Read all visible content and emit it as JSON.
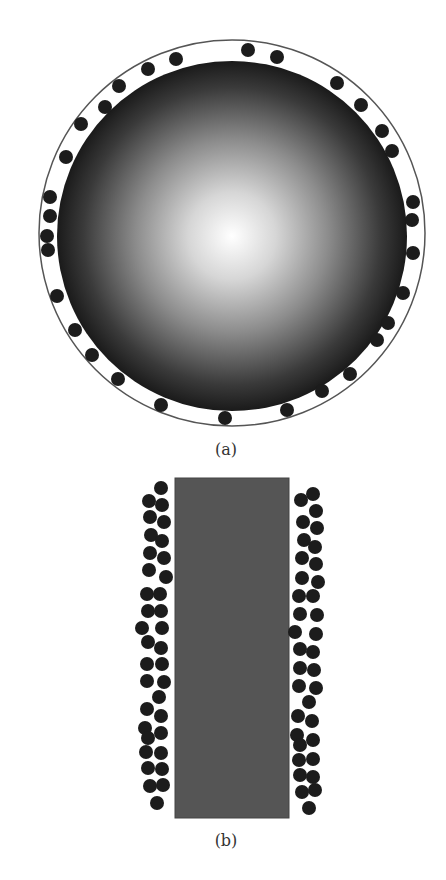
{
  "figure": {
    "panels": [
      {
        "id": "a",
        "label": "(a)",
        "description": "Spherical particle surrounded by small adsorbed particles inside a thin outer boundary circle",
        "outer_circle": {
          "cx": 232,
          "cy": 233,
          "r": 193,
          "stroke": "#555555"
        },
        "sphere": {
          "cx": 232,
          "cy": 236,
          "r": 175,
          "center_color": "#ffffff",
          "edge_color": "#1a1a1a"
        },
        "dot_radius": 7,
        "dot_color": "#1c1c1c",
        "dots": [
          [
            248,
            50
          ],
          [
            277,
            57
          ],
          [
            176,
            59
          ],
          [
            148,
            69
          ],
          [
            119,
            86
          ],
          [
            105,
            107
          ],
          [
            81,
            124
          ],
          [
            66,
            157
          ],
          [
            50,
            197
          ],
          [
            50,
            216
          ],
          [
            47,
            236
          ],
          [
            48,
            250
          ],
          [
            57,
            296
          ],
          [
            75,
            330
          ],
          [
            92,
            355
          ],
          [
            118,
            379
          ],
          [
            161,
            405
          ],
          [
            225,
            418
          ],
          [
            287,
            410
          ],
          [
            322,
            391
          ],
          [
            350,
            374
          ],
          [
            377,
            340
          ],
          [
            388,
            323
          ],
          [
            403,
            293
          ],
          [
            413,
            253
          ],
          [
            412,
            220
          ],
          [
            413,
            202
          ],
          [
            392,
            151
          ],
          [
            382,
            131
          ],
          [
            361,
            105
          ],
          [
            337,
            83
          ]
        ],
        "label_pos": {
          "x": 226,
          "y": 455
        }
      },
      {
        "id": "b",
        "label": "(b)",
        "description": "Cylindrical/rectangular body with particles adsorbed along both sides",
        "rect": {
          "x": 175,
          "y": 478,
          "width": 114,
          "height": 340,
          "fill": "#555555",
          "stroke": "#444444"
        },
        "dot_radius": 7,
        "dot_color": "#1c1c1c",
        "left_dots": [
          [
            161,
            488
          ],
          [
            149,
            501
          ],
          [
            162,
            505
          ],
          [
            150,
            517
          ],
          [
            164,
            522
          ],
          [
            151,
            535
          ],
          [
            162,
            541
          ],
          [
            150,
            553
          ],
          [
            164,
            558
          ],
          [
            149,
            570
          ],
          [
            166,
            577
          ],
          [
            147,
            594
          ],
          [
            160,
            594
          ],
          [
            148,
            611
          ],
          [
            161,
            611
          ],
          [
            142,
            628
          ],
          [
            162,
            628
          ],
          [
            148,
            642
          ],
          [
            161,
            648
          ],
          [
            147,
            664
          ],
          [
            162,
            664
          ],
          [
            147,
            681
          ],
          [
            164,
            682
          ],
          [
            159,
            697
          ],
          [
            147,
            709
          ],
          [
            161,
            716
          ],
          [
            145,
            728
          ],
          [
            148,
            738
          ],
          [
            161,
            733
          ],
          [
            146,
            752
          ],
          [
            161,
            753
          ],
          [
            148,
            768
          ],
          [
            162,
            769
          ],
          [
            150,
            786
          ],
          [
            163,
            785
          ],
          [
            157,
            803
          ]
        ],
        "right_dots": [
          [
            313,
            494
          ],
          [
            301,
            500
          ],
          [
            316,
            511
          ],
          [
            303,
            522
          ],
          [
            317,
            528
          ],
          [
            304,
            540
          ],
          [
            315,
            547
          ],
          [
            302,
            558
          ],
          [
            316,
            564
          ],
          [
            302,
            578
          ],
          [
            318,
            582
          ],
          [
            299,
            596
          ],
          [
            313,
            596
          ],
          [
            300,
            614
          ],
          [
            317,
            615
          ],
          [
            295,
            632
          ],
          [
            316,
            634
          ],
          [
            300,
            649
          ],
          [
            313,
            652
          ],
          [
            300,
            668
          ],
          [
            314,
            670
          ],
          [
            299,
            686
          ],
          [
            316,
            688
          ],
          [
            309,
            702
          ],
          [
            298,
            716
          ],
          [
            312,
            721
          ],
          [
            297,
            735
          ],
          [
            300,
            745
          ],
          [
            313,
            740
          ],
          [
            299,
            760
          ],
          [
            313,
            759
          ],
          [
            300,
            775
          ],
          [
            313,
            777
          ],
          [
            302,
            792
          ],
          [
            315,
            790
          ],
          [
            309,
            808
          ]
        ],
        "label_pos": {
          "x": 226,
          "y": 846
        }
      }
    ]
  }
}
